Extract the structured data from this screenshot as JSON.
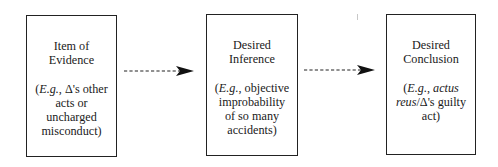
{
  "diagram": {
    "type": "flowchart",
    "direction": "left-to-right",
    "colors": {
      "stroke": "#222222",
      "text": "#1a1a1a",
      "background": "#ffffff"
    },
    "nodes": [
      {
        "id": "evidence",
        "title_lines": [
          "Item of",
          "Evidence"
        ],
        "example_lines": {
          "l1_open": "(",
          "l1_eg": "E.g.",
          "l1_rest": ", Δ's other",
          "l2": "acts or",
          "l3": "uncharged",
          "l4": "misconduct)"
        }
      },
      {
        "id": "inference",
        "title_lines": [
          "Desired",
          "Inference"
        ],
        "example_lines": {
          "l1_open": "(",
          "l1_eg": "E.g.",
          "l1_rest": ", objective",
          "l2": "improbability",
          "l3": "of so many",
          "l4": "accidents)"
        }
      },
      {
        "id": "conclusion",
        "title_lines": [
          "Desired",
          "Conclusion"
        ],
        "example_lines": {
          "l1_open": "(",
          "l1_eg": "E.g.",
          "l1_mid": ", ",
          "l1_italic": "actus",
          "l2_italic": "reus",
          "l2_rest": "/Δ's guilty",
          "l3": "act)"
        }
      }
    ],
    "edges": [
      {
        "from": "evidence",
        "to": "inference",
        "style": "dashed",
        "arrowhead": "filled-triangle"
      },
      {
        "from": "inference",
        "to": "conclusion",
        "style": "dashed",
        "arrowhead": "filled-triangle"
      }
    ]
  }
}
